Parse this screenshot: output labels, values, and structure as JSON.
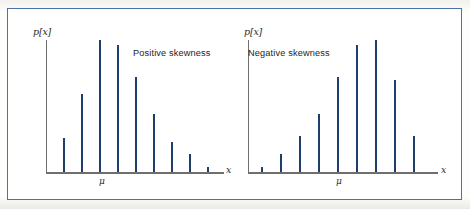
{
  "figure": {
    "background": "#ffffff",
    "frame_color": "#4a72a8",
    "bar_color": "#2c5c96",
    "axis_color": "#6f6f6f"
  },
  "chart_data": [
    {
      "type": "bar",
      "title": "Positive skewness",
      "xlabel": "x",
      "ylabel": "p[x]",
      "mean_label": "μ",
      "grid": false,
      "legend": "none",
      "xlim": [
        0,
        10
      ],
      "ylim": [
        0,
        1.0
      ],
      "categories": [
        "1",
        "2",
        "3",
        "4",
        "5",
        "6",
        "7",
        "8",
        "9",
        "10"
      ],
      "values": [
        0.26,
        0.59,
        1.0,
        0.96,
        0.72,
        0.44,
        0.23,
        0.14,
        0.04,
        0.0
      ],
      "mean_category_index": 3,
      "annotations": [
        "Positive skewness"
      ]
    },
    {
      "type": "bar",
      "title": "Negative skewness",
      "xlabel": "x",
      "ylabel": "p[x]",
      "mean_label": "μ",
      "grid": false,
      "legend": "none",
      "xlim": [
        0,
        10
      ],
      "ylim": [
        0,
        1.0
      ],
      "categories": [
        "1",
        "2",
        "3",
        "4",
        "5",
        "6",
        "7",
        "8",
        "9",
        "10"
      ],
      "values": [
        0.04,
        0.14,
        0.27,
        0.44,
        0.72,
        0.96,
        1.0,
        0.7,
        0.27,
        0.0
      ],
      "mean_category_index": 5,
      "annotations": [
        "Negative skewness"
      ]
    }
  ],
  "panels": {
    "left": {
      "caption": "Positive skewness",
      "ylabel": "p[x]",
      "xlabel": "x",
      "mu": "μ"
    },
    "right": {
      "caption": "Negative skewness",
      "ylabel": "p[x]",
      "xlabel": "x",
      "mu": "μ"
    }
  }
}
